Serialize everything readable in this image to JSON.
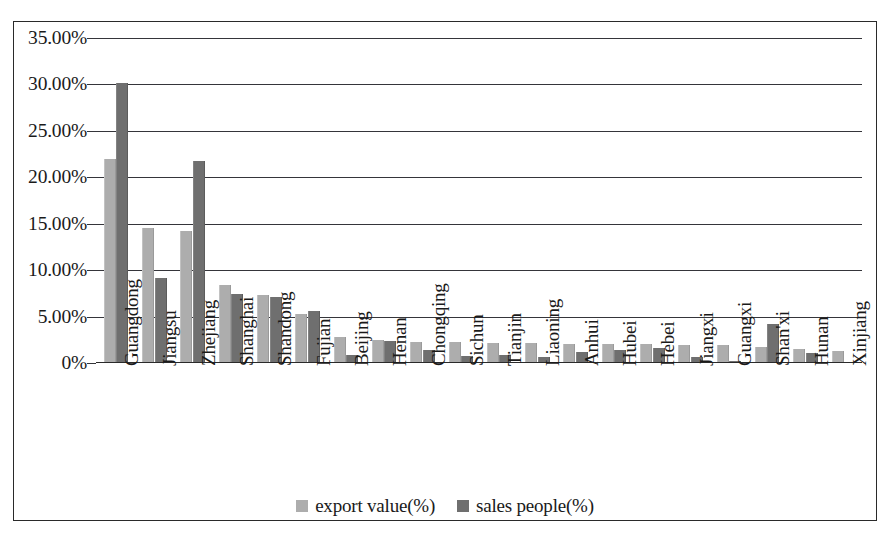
{
  "chart_data": {
    "type": "bar",
    "title": "",
    "subtitle": "",
    "xlabel": "",
    "ylabel": "",
    "ylim": [
      0,
      35
    ],
    "ytick_labels": [
      "35.00%",
      "30.00%",
      "25.00%",
      "20.00%",
      "15.00%",
      "10.00%",
      "5.00%",
      "0%"
    ],
    "ytick_values": [
      35,
      30,
      25,
      20,
      15,
      10,
      5,
      0
    ],
    "grid": true,
    "legend_position": "bottom",
    "categories": [
      "Guangdong",
      "Jiangsu",
      "Zhejiang",
      "Shanghai",
      "Shandong",
      "Fujian",
      "Beijing",
      "Henan",
      "Chongqing",
      "Sichun",
      "Tianjin",
      "Liaoning",
      "Anhui",
      "Hubei",
      "Hebei",
      "Jiangxi",
      "Guangxi",
      "Shan'xi",
      "Hunan",
      "Xinjiang"
    ],
    "series": [
      {
        "name": "export value(%)",
        "color": "#adadad",
        "values": [
          22.0,
          14.5,
          14.2,
          8.4,
          7.3,
          5.3,
          2.8,
          2.5,
          2.3,
          2.3,
          2.2,
          2.2,
          2.0,
          2.0,
          2.0,
          1.9,
          1.9,
          1.7,
          1.5,
          1.3
        ]
      },
      {
        "name": "sales people(%)",
        "color": "#6f6f6f",
        "values": [
          30.2,
          9.2,
          21.8,
          7.4,
          7.1,
          5.6,
          0.9,
          2.4,
          1.4,
          0.8,
          0.9,
          0.7,
          1.2,
          1.4,
          1.6,
          0.7,
          0.2,
          4.2,
          1.1,
          0.0
        ]
      }
    ]
  },
  "legend": {
    "items": [
      {
        "label": "export value(%)",
        "swatch": "export"
      },
      {
        "label": "sales people(%)",
        "swatch": "sales"
      }
    ]
  }
}
